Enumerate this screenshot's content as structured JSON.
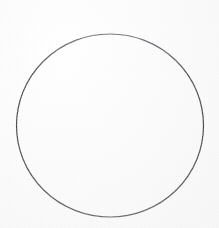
{
  "page": {
    "kind": "scanned-document-page",
    "width": 219,
    "height": 228,
    "background_color": "#f9f9f9",
    "paper_tint": "#fbfbfb",
    "caption": "",
    "visible_text": ""
  },
  "figure": {
    "name": "circle",
    "shape": "circle",
    "label": "",
    "center_x": 110,
    "center_y": 125.5,
    "radius_x": 93.5,
    "radius_y": 91.5,
    "bounds": {
      "left": 16,
      "top": 34,
      "right": 203,
      "bottom": 217
    },
    "stroke_color": "#4f4f55",
    "stroke_color_light": "#73737a",
    "stroke_width": 1.2,
    "fill": "none"
  },
  "artifacts": {
    "description": "faint illegible bleed-through text from the reverse side of the sheet",
    "ghost_text_1": "            ",
    "ghost_text_2": "          ",
    "ghost_text_3": "    ",
    "ghost_text_4": "   ",
    "ghost_text_5": "        "
  }
}
